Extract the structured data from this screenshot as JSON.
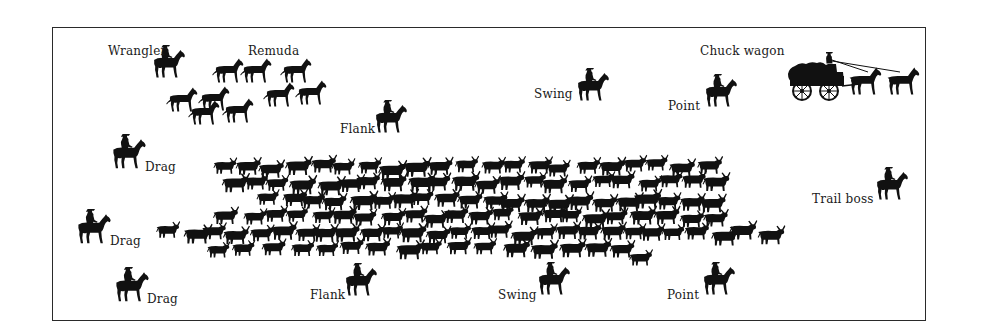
{
  "diagram": {
    "colors": {
      "ink": "#111111",
      "background": "#ffffff",
      "frame": "#2a2a2a"
    },
    "labels": [
      {
        "id": "wrangler",
        "text": "Wrangler",
        "x": 108,
        "y": 45
      },
      {
        "id": "remuda",
        "text": "Remuda",
        "x": 248,
        "y": 45
      },
      {
        "id": "chuck-wagon",
        "text": "Chuck wagon",
        "x": 700,
        "y": 45
      },
      {
        "id": "swing-top",
        "text": "Swing",
        "x": 534,
        "y": 88
      },
      {
        "id": "point-top",
        "text": "Point",
        "x": 668,
        "y": 100
      },
      {
        "id": "flank-top",
        "text": "Flank",
        "x": 340,
        "y": 123
      },
      {
        "id": "drag-1",
        "text": "Drag",
        "x": 145,
        "y": 161
      },
      {
        "id": "trail-boss",
        "text": "Trail boss",
        "x": 812,
        "y": 193
      },
      {
        "id": "drag-2",
        "text": "Drag",
        "x": 110,
        "y": 235
      },
      {
        "id": "drag-3",
        "text": "Drag",
        "x": 147,
        "y": 293
      },
      {
        "id": "flank-bottom",
        "text": "Flank",
        "x": 310,
        "y": 289
      },
      {
        "id": "swing-bottom",
        "text": "Swing",
        "x": 498,
        "y": 289
      },
      {
        "id": "point-bottom",
        "text": "Point",
        "x": 667,
        "y": 289
      }
    ],
    "riders": [
      {
        "role": "wrangler",
        "x": 150,
        "y": 44,
        "s": 1.0
      },
      {
        "role": "swing-top",
        "x": 574,
        "y": 67,
        "s": 1.0
      },
      {
        "role": "point-top",
        "x": 702,
        "y": 73,
        "s": 1.0
      },
      {
        "role": "flank-top",
        "x": 372,
        "y": 99,
        "s": 1.0
      },
      {
        "role": "drag-1",
        "x": 109,
        "y": 133,
        "s": 1.05
      },
      {
        "role": "trail-boss",
        "x": 873,
        "y": 166,
        "s": 1.0
      },
      {
        "role": "drag-2",
        "x": 74,
        "y": 208,
        "s": 1.05
      },
      {
        "role": "drag-3",
        "x": 112,
        "y": 266,
        "s": 1.05
      },
      {
        "role": "flank-bottom",
        "x": 342,
        "y": 262,
        "s": 1.0
      },
      {
        "role": "swing-bottom",
        "x": 535,
        "y": 261,
        "s": 1.0
      },
      {
        "role": "point-bottom",
        "x": 700,
        "y": 261,
        "s": 1.0
      }
    ],
    "remuda_horses": [
      {
        "x": 212,
        "y": 58
      },
      {
        "x": 240,
        "y": 58
      },
      {
        "x": 280,
        "y": 58
      },
      {
        "x": 166,
        "y": 87
      },
      {
        "x": 198,
        "y": 86
      },
      {
        "x": 263,
        "y": 82
      },
      {
        "x": 295,
        "y": 80
      },
      {
        "x": 188,
        "y": 100
      },
      {
        "x": 222,
        "y": 98
      }
    ],
    "wagon": {
      "x": 782,
      "y": 48
    },
    "herd_rows": [
      {
        "y": 156,
        "x_start": 212,
        "x_end": 700,
        "step": 24
      },
      {
        "y": 172,
        "x_start": 220,
        "x_end": 720,
        "step": 23
      },
      {
        "y": 190,
        "x_start": 258,
        "x_end": 716,
        "step": 22
      },
      {
        "y": 206,
        "x_start": 215,
        "x_end": 700,
        "step": 23
      },
      {
        "y": 222,
        "x_start": 158,
        "x_end": 760,
        "step": 22
      },
      {
        "y": 238,
        "x_start": 205,
        "x_end": 620,
        "step": 27
      },
      {
        "y": 246,
        "x_start": 628,
        "x_end": 650,
        "step": 30
      }
    ]
  }
}
